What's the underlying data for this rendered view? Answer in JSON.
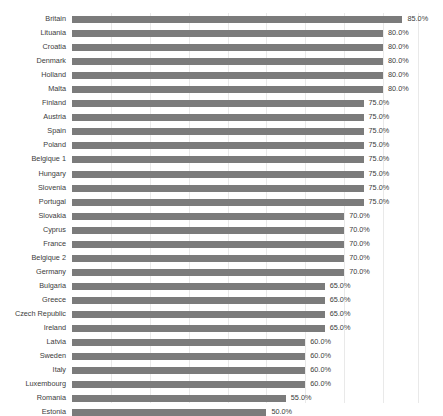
{
  "chart_data": {
    "type": "bar",
    "orientation": "horizontal",
    "title": "",
    "subtitle": "",
    "xlabel": "",
    "ylabel": "",
    "xlim": [
      0,
      89
    ],
    "grid": true,
    "grid_axis": "x",
    "legend": false,
    "legend_position": "none",
    "value_format": "{v}%",
    "bar_color": "#7b7b7b",
    "gridline_color": "#e9e9e9",
    "text_color": "#3c3c3c",
    "background": "#ffffff",
    "gridline_values": [
      10,
      20,
      30,
      40,
      50,
      60,
      70,
      80,
      89
    ],
    "tick_labels": [],
    "categories": [
      "Britain",
      "Lituania",
      "Croatia",
      "Denmark",
      "Holland",
      "Malta",
      "Finland",
      "Austria",
      "Spain",
      "Poland",
      "Belgique 1",
      "Hungary",
      "Slovenia",
      "Portugal",
      "Slovakia",
      "Cyprus",
      "France",
      "Belgique 2",
      "Germany",
      "Bulgaria",
      "Greece",
      "Czech Republic",
      "Ireland",
      "Latvia",
      "Sweden",
      "Italy",
      "Luxembourg",
      "Romania",
      "Estonia"
    ],
    "values": [
      85.0,
      80.0,
      80.0,
      80.0,
      80.0,
      80.0,
      75.0,
      75.0,
      75.0,
      75.0,
      75.0,
      75.0,
      75.0,
      75.0,
      70.0,
      70.0,
      70.0,
      70.0,
      70.0,
      65.0,
      65.0,
      65.0,
      65.0,
      60.0,
      60.0,
      60.0,
      60.0,
      55.0,
      50.0
    ],
    "data_labels": [
      "85.0%",
      "80.0%",
      "80.0%",
      "80.0%",
      "80.0%",
      "80.0%",
      "75.0%",
      "75.0%",
      "75.0%",
      "75.0%",
      "75.0%",
      "75.0%",
      "75.0%",
      "75.0%",
      "70.0%",
      "70.0%",
      "70.0%",
      "70.0%",
      "70.0%",
      "65.0%",
      "65.0%",
      "65.0%",
      "65.0%",
      "60.0%",
      "60.0%",
      "60.0%",
      "60.0%",
      "55.0%",
      "50.0%"
    ]
  }
}
